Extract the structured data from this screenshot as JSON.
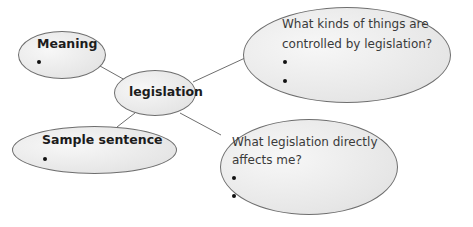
{
  "diagram": {
    "type": "mind-map",
    "center": {
      "label": "legislation"
    },
    "nodes": [
      {
        "id": "meaning",
        "label": "Meaning",
        "bullets": 1
      },
      {
        "id": "sample-sentence",
        "label": "Sample sentence",
        "bullets": 1
      },
      {
        "id": "controlled",
        "label_lines": [
          "What kinds of things are",
          "controlled by legislation?"
        ],
        "bullets": 2
      },
      {
        "id": "affects-me",
        "label_lines": [
          "What legislation directly",
          "affects me?"
        ],
        "bullets": 2
      }
    ],
    "colors": {
      "fill": "#e6e6e6",
      "stroke": "#6e6e6e",
      "text": "#1c1c1c"
    }
  }
}
